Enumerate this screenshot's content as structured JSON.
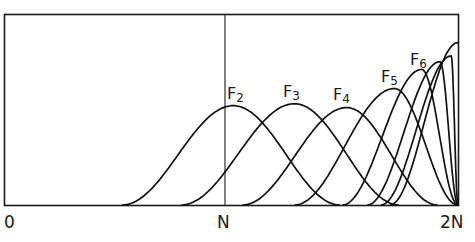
{
  "chart_data": {
    "type": "line",
    "title": "",
    "xlabel": "",
    "ylabel": "",
    "x_ticks": [
      "0",
      "N",
      "2N"
    ],
    "xlim": [
      "0",
      "2N"
    ],
    "grid": false,
    "reference_lines": [
      {
        "x": "N",
        "orientation": "vertical"
      }
    ],
    "series": [
      {
        "name": "F2",
        "label_main": "F",
        "label_sub": "2",
        "start": 0.52,
        "peak_x": 1.01,
        "peak_height": 0.52,
        "end": 1.48
      },
      {
        "name": "F3",
        "label_main": "F",
        "label_sub": "3",
        "start": 0.78,
        "peak_x": 1.28,
        "peak_height": 0.53,
        "end": 1.74
      },
      {
        "name": "F4",
        "label_main": "F",
        "label_sub": "4",
        "start": 1.05,
        "peak_x": 1.51,
        "peak_height": 0.51,
        "end": 1.91
      },
      {
        "name": "F5",
        "label_main": "F",
        "label_sub": "5",
        "start": 1.28,
        "peak_x": 1.72,
        "peak_height": 0.61,
        "end": 2.0
      },
      {
        "name": "F6",
        "label_main": "F",
        "label_sub": "6",
        "start": 1.49,
        "peak_x": 1.84,
        "peak_height": 0.71,
        "end": 2.0
      },
      {
        "name": "F7",
        "label_main": "",
        "label_sub": "",
        "start": 1.6,
        "peak_x": 1.92,
        "peak_height": 0.75,
        "end": 2.0
      },
      {
        "name": "F8",
        "label_main": "",
        "label_sub": "",
        "start": 1.66,
        "peak_x": 1.97,
        "peak_height": 0.78,
        "end": 2.0
      },
      {
        "name": "F9",
        "label_main": "",
        "label_sub": "",
        "start": 1.7,
        "peak_x": 2.0,
        "peak_height": 0.85,
        "end": 2.0
      }
    ]
  },
  "axis": {
    "label_0": "0",
    "label_n": "N",
    "label_2n": "2N"
  },
  "labels": {
    "f2": {
      "main": "F",
      "sub": "2"
    },
    "f3": {
      "main": "F",
      "sub": "3"
    },
    "f4": {
      "main": "F",
      "sub": "4"
    },
    "f5": {
      "main": "F",
      "sub": "5"
    },
    "f6": {
      "main": "F",
      "sub": "6"
    }
  }
}
